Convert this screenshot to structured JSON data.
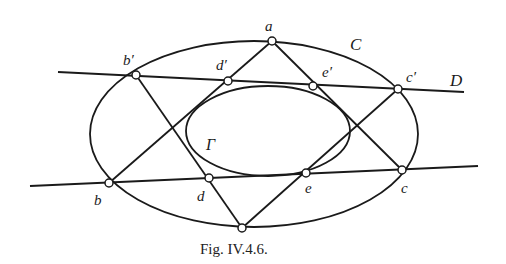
{
  "figure": {
    "caption": "Fig. IV.4.6.",
    "curves": {
      "outer": {
        "label": "C",
        "cx": 254,
        "cy": 134,
        "rx": 164,
        "ry": 93
      },
      "inner": {
        "label": "Γ",
        "cx": 268,
        "cy": 131,
        "rx": 82,
        "ry": 45
      }
    },
    "lines": {
      "upper": {
        "label": "D",
        "x1": 58,
        "y1": 72,
        "x2": 464,
        "y2": 92
      },
      "lower": {
        "label": "",
        "x1": 30,
        "y1": 186,
        "x2": 478,
        "y2": 166
      }
    },
    "points": {
      "a": {
        "label": "a",
        "x": 272,
        "y": 41
      },
      "b1": {
        "label": "b′",
        "x": 136,
        "y": 75
      },
      "d1": {
        "label": "d′",
        "x": 228,
        "y": 81
      },
      "e1": {
        "label": "e′",
        "x": 313,
        "y": 86
      },
      "c1": {
        "label": "c′",
        "x": 398,
        "y": 89
      },
      "b": {
        "label": "b",
        "x": 109,
        "y": 183
      },
      "d": {
        "label": "d",
        "x": 209,
        "y": 178
      },
      "e": {
        "label": "e",
        "x": 306,
        "y": 173
      },
      "c": {
        "label": "c",
        "x": 402,
        "y": 170
      },
      "f": {
        "label": "",
        "x": 242,
        "y": 228
      }
    },
    "labels": {
      "a": "a",
      "b1": "b′",
      "d1": "d′",
      "e1": "e′",
      "c1": "c′",
      "b": "b",
      "d": "d",
      "e": "e",
      "c": "c",
      "C": "C",
      "D": "D",
      "Gamma": "Γ"
    }
  }
}
